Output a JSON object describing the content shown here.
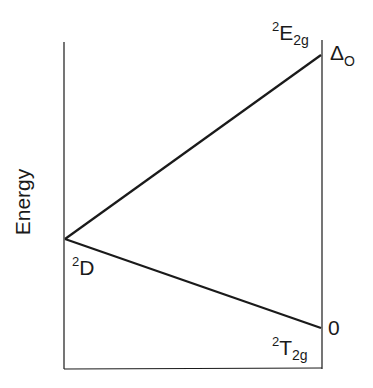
{
  "diagram": {
    "type": "energy-level-splitting",
    "y_axis_label": "Energy",
    "free_ion_term": {
      "sup": "2",
      "main": "D"
    },
    "upper_term": {
      "sup": "2",
      "main": "E",
      "sub": "2g"
    },
    "lower_term": {
      "sup": "2",
      "main": "T",
      "sub": "2g"
    },
    "upper_energy_label": {
      "main": "Δ",
      "sub": "O"
    },
    "lower_energy_label": "0",
    "colors": {
      "line": "#1a1a1a",
      "background": "#ffffff"
    }
  }
}
